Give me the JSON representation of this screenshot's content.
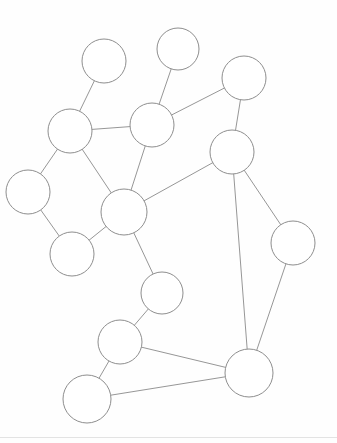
{
  "figure": {
    "title": "",
    "background_color": "#fefefe",
    "node_fill": "#ffffff",
    "node_stroke": "#8e8e8e",
    "edge_stroke": "#8a8a8a",
    "rule_color": "#e3e3e3",
    "width": 337,
    "height": 443
  },
  "rules": [
    {
      "name": "bottom-rule",
      "y": 437
    }
  ],
  "chart_data": {
    "type": "diagram",
    "subtype": "node-link-graph",
    "title": "",
    "xlabel": "",
    "ylabel": "",
    "grid": false,
    "legend": "none",
    "directed": false,
    "node_count": 16,
    "edge_count": 19,
    "xlim": [
      0,
      337
    ],
    "ylim": [
      0,
      443
    ],
    "nodes": [
      {
        "id": "n1",
        "label": "",
        "x": 104,
        "y": 61,
        "r": 22
      },
      {
        "id": "n2",
        "label": "",
        "x": 178,
        "y": 49,
        "r": 21
      },
      {
        "id": "n3",
        "label": "",
        "x": 244,
        "y": 78,
        "r": 22
      },
      {
        "id": "n4",
        "label": "",
        "x": 70,
        "y": 131,
        "r": 22
      },
      {
        "id": "n5",
        "label": "",
        "x": 152,
        "y": 125,
        "r": 22
      },
      {
        "id": "n6",
        "label": "",
        "x": 232,
        "y": 152,
        "r": 22
      },
      {
        "id": "n7",
        "label": "",
        "x": 28,
        "y": 192,
        "r": 22
      },
      {
        "id": "n8",
        "label": "",
        "x": 124,
        "y": 212,
        "r": 23
      },
      {
        "id": "n9",
        "label": "",
        "x": 293,
        "y": 243,
        "r": 22
      },
      {
        "id": "n10",
        "label": "",
        "x": 72,
        "y": 254,
        "r": 22
      },
      {
        "id": "n11",
        "label": "",
        "x": 162,
        "y": 293,
        "r": 21
      },
      {
        "id": "n12",
        "label": "",
        "x": 120,
        "y": 342,
        "r": 22
      },
      {
        "id": "n13",
        "label": "",
        "x": 249,
        "y": 373,
        "r": 24
      },
      {
        "id": "n14",
        "label": "",
        "x": 87,
        "y": 399,
        "r": 24
      }
    ],
    "edges": [
      {
        "source": "n1",
        "target": "n4"
      },
      {
        "source": "n2",
        "target": "n5"
      },
      {
        "source": "n3",
        "target": "n5"
      },
      {
        "source": "n3",
        "target": "n6"
      },
      {
        "source": "n4",
        "target": "n5"
      },
      {
        "source": "n4",
        "target": "n7"
      },
      {
        "source": "n4",
        "target": "n8"
      },
      {
        "source": "n5",
        "target": "n8"
      },
      {
        "source": "n6",
        "target": "n8"
      },
      {
        "source": "n6",
        "target": "n9"
      },
      {
        "source": "n6",
        "target": "n13"
      },
      {
        "source": "n7",
        "target": "n10"
      },
      {
        "source": "n8",
        "target": "n10"
      },
      {
        "source": "n8",
        "target": "n11"
      },
      {
        "source": "n9",
        "target": "n13"
      },
      {
        "source": "n11",
        "target": "n12"
      },
      {
        "source": "n12",
        "target": "n13"
      },
      {
        "source": "n12",
        "target": "n14"
      },
      {
        "source": "n14",
        "target": "n13"
      }
    ]
  }
}
